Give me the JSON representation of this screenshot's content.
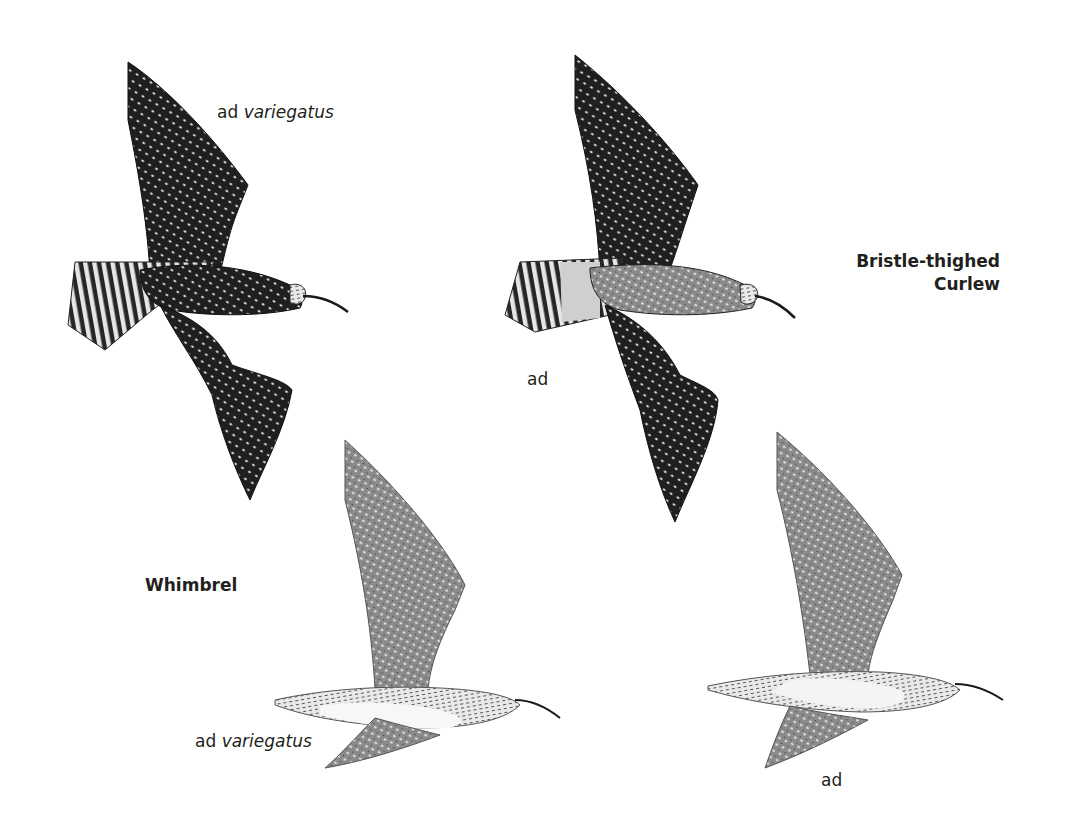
{
  "plate": {
    "species": [
      {
        "name": "Whimbrel"
      },
      {
        "name_line1": "Bristle-thighed",
        "name_line2": "Curlew"
      }
    ],
    "figures": [
      {
        "id": "whimbrel-variegatus-upper",
        "age": "ad",
        "subspecies": "variegatus",
        "view": "upperwing"
      },
      {
        "id": "bristle-thighed-upper",
        "age": "ad",
        "view": "upperwing"
      },
      {
        "id": "whimbrel-variegatus-under",
        "age": "ad",
        "subspecies": "variegatus",
        "view": "underwing"
      },
      {
        "id": "bristle-thighed-under",
        "age": "ad",
        "view": "underwing"
      }
    ]
  },
  "labels": {
    "top_left": {
      "age": "ad",
      "subspecies": "variegatus"
    },
    "top_right": {
      "age": "ad"
    },
    "bottom_left": {
      "age": "ad",
      "subspecies": "variegatus"
    },
    "bottom_right": {
      "age": "ad"
    },
    "whimbrel": "Whimbrel",
    "btc_line1": "Bristle-thighed",
    "btc_line2": "Curlew"
  },
  "colors": {
    "background": "#ffffff",
    "text": "#231f20",
    "dark_plumage": "#1e1e1e",
    "mid_plumage": "#6b6b6b",
    "light_plumage": "#d9d9d9"
  }
}
